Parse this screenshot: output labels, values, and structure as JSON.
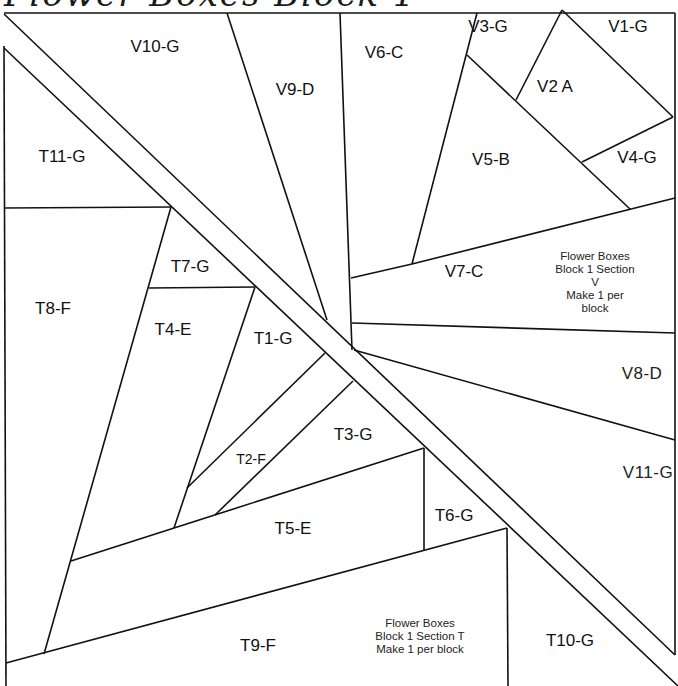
{
  "title": "Flower Boxes Block 1",
  "diagram": {
    "type": "paper-piecing-pattern",
    "sections": [
      {
        "id": "V",
        "note": [
          "Flower Boxes",
          "Block 1 Section V",
          "Make 1 per block"
        ],
        "pieces": [
          {
            "label": "V1-G",
            "x": 628,
            "y": 27
          },
          {
            "label": "V2 A",
            "x": 555,
            "y": 87
          },
          {
            "label": "V3-G",
            "x": 488,
            "y": 27
          },
          {
            "label": "V4-G",
            "x": 637,
            "y": 158
          },
          {
            "label": "V5-B",
            "x": 491,
            "y": 160
          },
          {
            "label": "V6-C",
            "x": 384,
            "y": 53
          },
          {
            "label": "V7-C",
            "x": 464,
            "y": 272
          },
          {
            "label": "V8-D",
            "x": 642,
            "y": 374
          },
          {
            "label": "V9-D",
            "x": 295,
            "y": 90
          },
          {
            "label": "V10-G",
            "x": 155,
            "y": 47
          },
          {
            "label": "V11-G",
            "x": 648,
            "y": 473
          }
        ]
      },
      {
        "id": "T",
        "note": [
          "Flower Boxes",
          "Block 1 Section T",
          "Make 1 per block"
        ],
        "pieces": [
          {
            "label": "T1-G",
            "x": 273,
            "y": 339
          },
          {
            "label": "T2-F",
            "x": 251,
            "y": 459
          },
          {
            "label": "T3-G",
            "x": 353,
            "y": 435
          },
          {
            "label": "T4-E",
            "x": 173,
            "y": 330
          },
          {
            "label": "T5-E",
            "x": 293,
            "y": 529
          },
          {
            "label": "T6-G",
            "x": 454,
            "y": 516
          },
          {
            "label": "T7-G",
            "x": 190,
            "y": 267
          },
          {
            "label": "T8-F",
            "x": 53,
            "y": 309
          },
          {
            "label": "T9-F",
            "x": 258,
            "y": 646
          },
          {
            "label": "T10-G",
            "x": 570,
            "y": 641
          },
          {
            "label": "T11-G",
            "x": 62,
            "y": 157
          }
        ]
      }
    ],
    "notes": {
      "V": {
        "x": 595,
        "y": 282
      },
      "T": {
        "x": 420,
        "y": 636
      }
    }
  }
}
